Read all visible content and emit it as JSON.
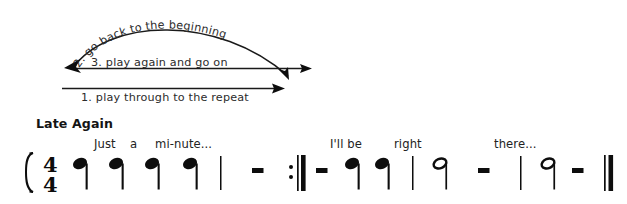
{
  "document": {
    "kind": "music-notation-figure",
    "background_color": "#ffffff",
    "ink_color": "#0d0d0d"
  },
  "annotations": {
    "curved_label": "2. go back to the beginning",
    "middle_label": "3. play again and go on",
    "bottom_label": "1. play through to the repeat"
  },
  "score": {
    "title": "Late Again",
    "time_signature": {
      "numerator": "4",
      "denominator": "4"
    },
    "lyrics": [
      {
        "text": "Just",
        "x": 94
      },
      {
        "text": "a",
        "x": 130
      },
      {
        "text": "mi-nute...",
        "x": 155
      },
      {
        "text": "I'll be",
        "x": 330
      },
      {
        "text": "right",
        "x": 394
      },
      {
        "text": "there...",
        "x": 494
      }
    ],
    "symbols": [
      {
        "name": "system-brace",
        "type": "brace",
        "x": 26
      },
      {
        "name": "time-signature",
        "type": "timesig",
        "x": 44
      },
      {
        "name": "quarter-note-1",
        "type": "quarter",
        "x": 76
      },
      {
        "name": "quarter-note-2",
        "type": "quarter",
        "x": 112
      },
      {
        "name": "quarter-note-3",
        "type": "quarter",
        "x": 148
      },
      {
        "name": "quarter-note-4",
        "type": "quarter",
        "x": 186
      },
      {
        "name": "barline-1",
        "type": "barline",
        "x": 220
      },
      {
        "name": "rest-1",
        "type": "rest",
        "x": 258
      },
      {
        "name": "repeat-end-barline",
        "type": "repeat-end",
        "x": 300
      },
      {
        "name": "rest-2",
        "type": "rest",
        "x": 321
      },
      {
        "name": "quarter-note-5",
        "type": "quarter",
        "x": 352
      },
      {
        "name": "quarter-note-6",
        "type": "quarter",
        "x": 382
      },
      {
        "name": "barline-2",
        "type": "barline",
        "x": 412
      },
      {
        "name": "half-note-1",
        "type": "half",
        "x": 440
      },
      {
        "name": "rest-3",
        "type": "rest",
        "x": 484
      },
      {
        "name": "barline-3",
        "type": "barline",
        "x": 520
      },
      {
        "name": "half-note-2",
        "type": "half",
        "x": 548
      },
      {
        "name": "rest-4",
        "type": "rest",
        "x": 578
      },
      {
        "name": "final-double-barline",
        "type": "final",
        "x": 608
      }
    ]
  }
}
